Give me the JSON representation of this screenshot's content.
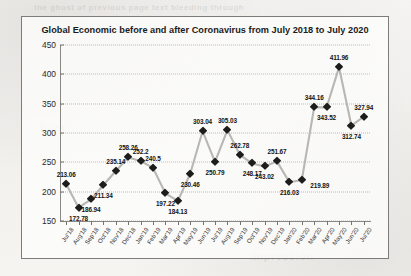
{
  "chart_data": {
    "type": "line",
    "title": "Global Economic before and after Coronavirus from July 2018 to July 2020",
    "xlabel": "",
    "ylabel": "",
    "ylim": [
      150,
      450
    ],
    "yticks": [
      150,
      200,
      250,
      300,
      350,
      400,
      450
    ],
    "grid": true,
    "legend": "none",
    "marker": "diamond",
    "categories": [
      "Jul'18",
      "Aug'18",
      "Sep'18",
      "Oct'18",
      "Nov'18",
      "Dec'18",
      "Jan'19",
      "Feb'19",
      "Mar'19",
      "Apr'19",
      "May'19",
      "Jun'19",
      "Jul'19",
      "Aug'19",
      "Sep'19",
      "Oct'19",
      "Nov'19",
      "Dec'19",
      "Jan'20",
      "Feb'20",
      "Mar'20",
      "Apr'20",
      "May'20",
      "Jun'20",
      "Jul'20"
    ],
    "values": [
      213.06,
      172.78,
      186.94,
      211.34,
      235.14,
      258.26,
      252.2,
      240.5,
      197.22,
      184.13,
      230.46,
      303.04,
      250.79,
      305.03,
      262.78,
      248.17,
      243.02,
      251.67,
      216.03,
      219.89,
      344.16,
      343.52,
      411.96,
      312.74,
      327.94
    ],
    "data_labels": [
      "213.06",
      "172.78",
      "186.94",
      "211.34",
      "235.14",
      "258.26",
      "252.2",
      "240.5",
      "197.22",
      "184.13",
      "230.46",
      "303.04",
      "250.79",
      "305.03",
      "262.78",
      "248.17",
      "243.02",
      "251.67",
      "216.03",
      "219.89",
      "344.16",
      "343.52",
      "411.96",
      "312.74",
      "327.94"
    ],
    "label_positions": [
      "above",
      "below",
      "below",
      "below",
      "above",
      "above",
      "above",
      "above",
      "below",
      "below",
      "below",
      "above",
      "below",
      "above",
      "above",
      "below",
      "below",
      "above",
      "below",
      "right",
      "above",
      "below",
      "above",
      "below",
      "above"
    ],
    "colors": {
      "line": "#b9b7b3",
      "marker": "#1d1d1d",
      "text": "#131313",
      "frame": "#7e7c78",
      "grid": "#8c8a84"
    }
  },
  "ghost_text": {
    "top": "the ghost of previous page text bleeding through",
    "mid_left": "faint",
    "mid_right": "impression"
  }
}
